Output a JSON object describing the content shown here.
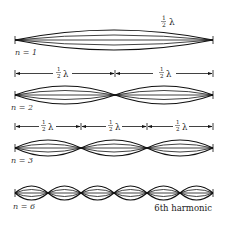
{
  "wavelength_label": "½ λ",
  "fraction_num": "1",
  "fraction_den": "2",
  "lambda": "λ",
  "modes": [
    {
      "n_label": "n = 1",
      "n": 1,
      "segments": 1
    },
    {
      "n_label": "n = 2",
      "n": 2,
      "segments": 2
    },
    {
      "n_label": "n = 3",
      "n": 3,
      "segments": 3
    },
    {
      "n_label": "n = 6",
      "n": 6,
      "segments": 6
    }
  ],
  "caption": "6th harmonic",
  "colors": {
    "line": "#111111",
    "text": "#222222",
    "background": "#ffffff"
  }
}
